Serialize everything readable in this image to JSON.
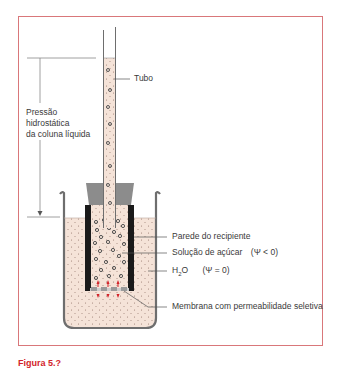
{
  "figure": {
    "labels": {
      "tube": "Tubo",
      "pressure_line1": "Pressão",
      "pressure_line2": "hidrostática",
      "pressure_line3": "da coluna líquida",
      "container_wall": "Parede do recipiente",
      "sugar_solution": "Solução de açúcar",
      "sugar_solution_psi": "(Ψ < 0)",
      "water_prefix": "H",
      "water_sub": "2",
      "water_suffix": "O",
      "water_psi": "(Ψ = 0)",
      "membrane": "Membrana com permeabilidade seletiva"
    },
    "colors": {
      "frame_border": "#d9777a",
      "solution_fill": "#f5e3d8",
      "container_wall": "#1a1a1a",
      "stopper": "#8c8c8c",
      "beaker_outline": "#6e6e6e",
      "flow_arrows": "#d2232a",
      "caption_accent": "#d2232a"
    }
  },
  "caption": {
    "figure_label": "Figura 5.?",
    "text": "(clipped caption text)"
  }
}
